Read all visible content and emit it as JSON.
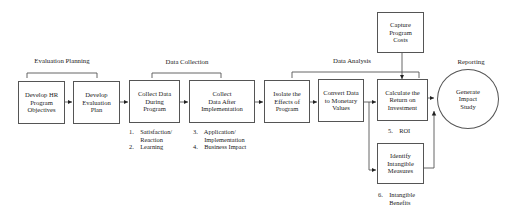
{
  "diagram": {
    "phases": [
      {
        "label": "Evaluation Planning"
      },
      {
        "label": "Data Collection"
      },
      {
        "label": "Data Analysis"
      },
      {
        "label": "Reporting"
      }
    ],
    "steps": [
      {
        "id": "develop-objectives",
        "label": "Develop HR\nProgram\nObjectives"
      },
      {
        "id": "develop-plan",
        "label": "Develop\nEvaluation\nPlan"
      },
      {
        "id": "collect-during",
        "label": "Collect Data\nDuring\nProgram"
      },
      {
        "id": "collect-after",
        "label": "Collect\nData After\nImplementation"
      },
      {
        "id": "isolate-effects",
        "label": "Isolate the\nEffects of\nProgram"
      },
      {
        "id": "convert-data",
        "label": "Convert Data\nto Monetary\nValues"
      },
      {
        "id": "calculate-roi",
        "label": "Calculate the\nReturn on\nInvestment"
      },
      {
        "id": "capture-costs",
        "label": "Capture\nProgram\nCosts"
      },
      {
        "id": "identify-intangibles",
        "label": "Identify\nIntangible\nMeasures"
      },
      {
        "id": "generate-study",
        "label": "Generate\nImpact\nStudy"
      }
    ],
    "notes": {
      "during": "1.    Satisfaction/\n       Reaction\n2.    Learning",
      "after": "3.    Application/\n       Implementation\n4.    Business Impact",
      "roi": "5.    ROI",
      "intangible": "6.    Intangible\n       Benefits"
    },
    "colors": {
      "line": "#555555",
      "arrow": "#222222",
      "text": "#222222"
    }
  }
}
